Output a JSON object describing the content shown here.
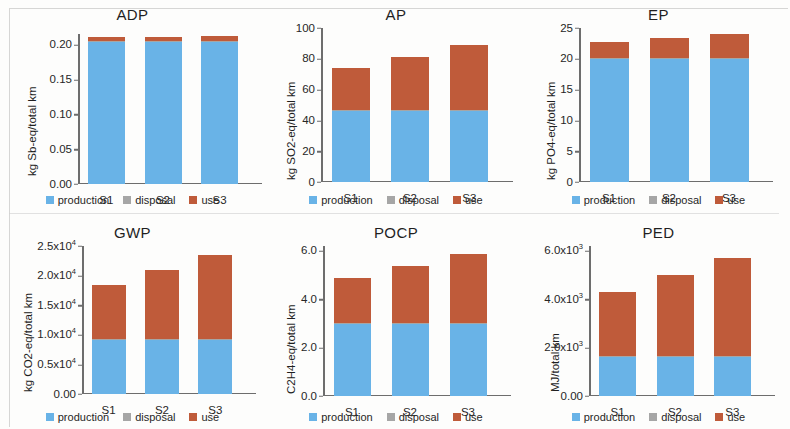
{
  "figure": {
    "categories": [
      "S1",
      "S2",
      "S3"
    ],
    "legend": [
      {
        "label": "production",
        "color": "#69b3e7",
        "key": "production"
      },
      {
        "label": "disposal",
        "color": "#a6a6a6",
        "key": "disposal"
      },
      {
        "label": "use",
        "color": "#bf5b3a",
        "key": "use"
      }
    ]
  },
  "chart_data": [
    {
      "type": "bar",
      "title": "ADP",
      "xlabel": "",
      "ylabel": "kg Sb-eq/total km",
      "categories": [
        "S1",
        "S2",
        "S3"
      ],
      "ylim": [
        0,
        0.215
      ],
      "yticks": [
        0.0,
        0.05,
        0.1,
        0.15,
        0.2
      ],
      "ytick_labels": [
        "0.00",
        "0.05",
        "0.10",
        "0.15",
        "0.20"
      ],
      "stacked": true,
      "grid": false,
      "legend_position": "bottom",
      "series": [
        {
          "name": "production",
          "values": [
            0.2045,
            0.2045,
            0.2045
          ]
        },
        {
          "name": "disposal",
          "values": [
            0.0008,
            0.0008,
            0.0008
          ]
        },
        {
          "name": "use",
          "values": [
            0.0057,
            0.0057,
            0.0067
          ]
        }
      ],
      "totals": [
        0.211,
        0.211,
        0.212
      ]
    },
    {
      "type": "bar",
      "title": "AP",
      "xlabel": "",
      "ylabel": "kg SO2-eq/total km",
      "categories": [
        "S1",
        "S2",
        "S3"
      ],
      "ylim": [
        0,
        100
      ],
      "yticks": [
        0,
        20,
        40,
        60,
        80,
        100
      ],
      "ytick_labels": [
        "0",
        "20",
        "40",
        "60",
        "80",
        "100"
      ],
      "stacked": true,
      "grid": false,
      "legend_position": "bottom",
      "series": [
        {
          "name": "production",
          "values": [
            46,
            46,
            46
          ]
        },
        {
          "name": "disposal",
          "values": [
            0.5,
            0.5,
            0.5
          ]
        },
        {
          "name": "use",
          "values": [
            27.5,
            34.5,
            42.5
          ]
        }
      ],
      "totals": [
        74,
        81,
        89
      ]
    },
    {
      "type": "bar",
      "title": "EP",
      "xlabel": "",
      "ylabel": "kg PO4-eq/total km",
      "categories": [
        "S1",
        "S2",
        "S3"
      ],
      "ylim": [
        0,
        25
      ],
      "yticks": [
        0,
        5,
        10,
        15,
        20,
        25
      ],
      "ytick_labels": [
        "0",
        "5",
        "10",
        "15",
        "20",
        "25"
      ],
      "stacked": true,
      "grid": false,
      "legend_position": "bottom",
      "series": [
        {
          "name": "production",
          "values": [
            20.0,
            20.0,
            20.0
          ]
        },
        {
          "name": "disposal",
          "values": [
            0.15,
            0.15,
            0.15
          ]
        },
        {
          "name": "use",
          "values": [
            2.55,
            3.25,
            3.95
          ]
        }
      ],
      "totals": [
        22.7,
        23.4,
        24.1
      ]
    },
    {
      "type": "bar",
      "title": "GWP",
      "xlabel": "",
      "ylabel": "kg CO2-eq/total km",
      "categories": [
        "S1",
        "S2",
        "S3"
      ],
      "ylim": [
        0,
        25000
      ],
      "yticks": [
        0,
        5000,
        10000,
        15000,
        20000,
        25000
      ],
      "ytick_labels": [
        "0.00",
        "0.5x10^4",
        "1.0x10^4",
        "1.5x10^4",
        "2.0x10^4",
        "2.5x10^4"
      ],
      "stacked": true,
      "grid": false,
      "legend_position": "bottom",
      "series": [
        {
          "name": "production",
          "values": [
            9200,
            9200,
            9200
          ]
        },
        {
          "name": "disposal",
          "values": [
            100,
            100,
            100
          ]
        },
        {
          "name": "use",
          "values": [
            9100,
            11600,
            14200
          ]
        }
      ],
      "totals": [
        18400,
        20900,
        23500
      ]
    },
    {
      "type": "bar",
      "title": "POCP",
      "xlabel": "",
      "ylabel": "C2H4-eq/total km",
      "categories": [
        "S1",
        "S2",
        "S3"
      ],
      "ylim": [
        0,
        6.2
      ],
      "yticks": [
        0.0,
        2.0,
        4.0,
        6.0
      ],
      "ytick_labels": [
        "0.0",
        "2.0",
        "4.0",
        "6.0"
      ],
      "stacked": true,
      "grid": false,
      "legend_position": "bottom",
      "series": [
        {
          "name": "production",
          "values": [
            3.0,
            3.0,
            3.0
          ]
        },
        {
          "name": "disposal",
          "values": [
            0.03,
            0.03,
            0.03
          ]
        },
        {
          "name": "use",
          "values": [
            1.85,
            2.35,
            2.85
          ]
        }
      ],
      "totals": [
        4.88,
        5.38,
        5.88
      ]
    },
    {
      "type": "bar",
      "title": "PED",
      "xlabel": "",
      "ylabel": "MJ/total km",
      "categories": [
        "S1",
        "S2",
        "S3"
      ],
      "ylim": [
        0,
        6200
      ],
      "yticks": [
        0,
        2000,
        4000,
        6000
      ],
      "ytick_labels": [
        "0.00",
        "2.0x10^3",
        "4.0x10^3",
        "6.0x10^3"
      ],
      "stacked": true,
      "grid": false,
      "legend_position": "bottom",
      "series": [
        {
          "name": "production",
          "values": [
            1620,
            1620,
            1620
          ]
        },
        {
          "name": "disposal",
          "values": [
            30,
            30,
            30
          ]
        },
        {
          "name": "use",
          "values": [
            2650,
            3350,
            4050
          ]
        }
      ],
      "totals": [
        4300,
        5000,
        5700
      ]
    }
  ]
}
